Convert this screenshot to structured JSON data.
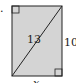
{
  "figure": {
    "problem_marker": ".",
    "shape": "rectangle",
    "fill_color": "#d4d4d4",
    "stroke_color": "#222222",
    "labels": {
      "diagonal": "13",
      "right_side": "10",
      "bottom_side": "x"
    },
    "right_angle_markers": [
      "top-left",
      "bottom-right"
    ]
  }
}
